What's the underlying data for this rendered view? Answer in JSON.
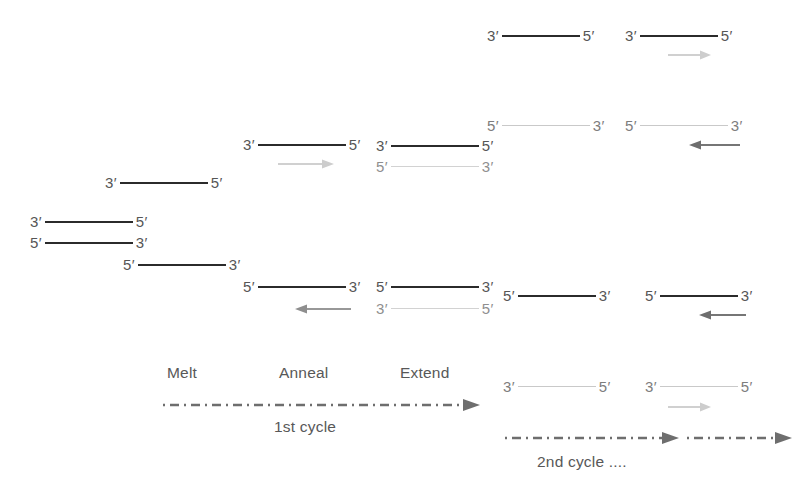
{
  "figure": {
    "type": "diagram",
    "colors": {
      "template_strand": "#2b2b2b",
      "new_strand": "#d2d2d2",
      "primer_arrow_light": "#cfcfcf",
      "primer_arrow_dark": "#7d7d7d",
      "timeline_arrow": "#6e6e6e",
      "text": "#585858",
      "background": "#ffffff"
    }
  },
  "labels": {
    "five_prime": "5′",
    "three_prime": "3′"
  },
  "stages": {
    "melt": "Melt",
    "anneal": "Anneal",
    "extend": "Extend"
  },
  "cycles": {
    "first": "1st cycle",
    "second": "2nd cycle ...."
  },
  "strands": {
    "original_top": {
      "left": "3′",
      "right": "5′"
    },
    "original_bottom": {
      "left": "5′",
      "right": "3′"
    },
    "melt_top": {
      "left": "3′",
      "right": "5′"
    },
    "melt_bottom": {
      "left": "5′",
      "right": "3′"
    },
    "anneal_top": {
      "left": "3′",
      "right": "5′"
    },
    "anneal_bottom": {
      "left": "5′",
      "right": "3′"
    },
    "extend_top_template": {
      "left": "3′",
      "right": "5′"
    },
    "extend_top_new": {
      "left": "5′",
      "right": "3′"
    },
    "extend_bottom_template": {
      "left": "5′",
      "right": "3′"
    },
    "extend_bottom_new": {
      "left": "3′",
      "right": "5′"
    },
    "c2_melt_a": {
      "left": "3′",
      "right": "5′"
    },
    "c2_melt_b": {
      "left": "5′",
      "right": "3′"
    },
    "c2_melt_c": {
      "left": "5′",
      "right": "3′"
    },
    "c2_melt_d": {
      "left": "3′",
      "right": "5′"
    },
    "c2_anneal_a": {
      "left": "3′",
      "right": "5′"
    },
    "c2_anneal_b": {
      "left": "5′",
      "right": "3′"
    },
    "c2_anneal_c": {
      "left": "5′",
      "right": "3′"
    },
    "c2_anneal_d": {
      "left": "3′",
      "right": "5′"
    }
  }
}
